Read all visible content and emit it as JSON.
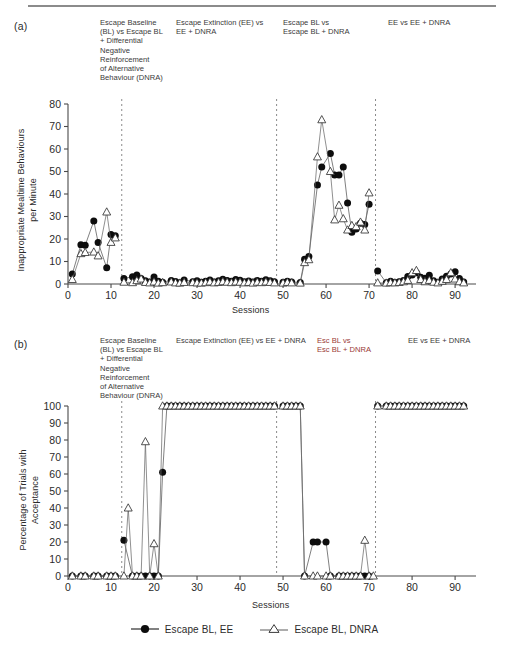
{
  "figure": {
    "panel_a_letter": "(a)",
    "panel_b_letter": "(b)"
  },
  "panel_a": {
    "phase_headers": [
      "Escape Baseline\n(BL) vs Escape BL\n+ Differential\nNegative\nReinforcement\nof Alternative\nBehaviour (DNRA)",
      "Escape Extinction (EE) vs\nEE + DNRA",
      "Escape BL vs\nEscape BL + DNRA",
      "EE vs EE + DNRA"
    ],
    "ylabel": "Inappropriate Mealtime Behaviours\nper Minute",
    "xlabel": "Sessions"
  },
  "panel_b": {
    "phase_headers": [
      "Escape Baseline\n(BL) vs Escape BL\n+ Differential\nNegative\nReinforcement\nof Alternative\nBehaviour (DNRA)",
      "Escape Extinction (EE) vs EE + DNRA",
      "Esc BL vs\nEsc BL + DNRA",
      "EE vs EE + DNRA"
    ],
    "ylabel": "Percentage of Trials with\nAcceptance",
    "xlabel": "Sessions"
  },
  "legend": {
    "items": [
      {
        "label": "Escape BL, EE",
        "marker": "filled-circle"
      },
      {
        "label": "Escape BL, DNRA",
        "marker": "open-triangle"
      }
    ]
  },
  "chart_data": [
    {
      "id": "panel-a",
      "type": "line",
      "title": "",
      "xlabel": "Sessions",
      "ylabel": "Inappropriate Mealtime Behaviours per Minute",
      "xlim": [
        0,
        93
      ],
      "ylim": [
        0,
        80
      ],
      "xticks": [
        0,
        10,
        20,
        30,
        40,
        50,
        60,
        70,
        80,
        90
      ],
      "yticks": [
        0,
        10,
        20,
        30,
        40,
        50,
        60,
        70,
        80
      ],
      "grid": false,
      "legend_position": "bottom",
      "phase_lines": [
        12.5,
        48.5,
        71.5
      ],
      "series": [
        {
          "name": "Escape BL, EE",
          "marker": "filled-circle",
          "x": [
            1,
            3,
            4,
            6,
            7,
            9,
            10,
            11,
            13,
            15,
            16,
            17,
            18,
            19,
            20,
            21,
            22,
            24,
            25,
            26,
            27,
            29,
            30,
            31,
            32,
            33,
            34,
            35,
            36,
            37,
            38,
            39,
            40,
            41,
            42,
            43,
            44,
            45,
            46,
            47,
            48,
            50,
            51,
            52,
            54,
            55,
            56,
            58,
            59,
            61,
            62,
            63,
            64,
            65,
            66,
            67,
            68,
            69,
            70,
            72,
            74,
            75,
            76,
            77,
            78,
            79,
            80,
            81,
            82,
            83,
            84,
            85,
            86,
            87,
            88,
            89,
            90,
            91,
            92
          ],
          "y": [
            4.5,
            17.5,
            17.2,
            28.0,
            18.5,
            7.2,
            22.0,
            21.5,
            2.5,
            3.2,
            4.0,
            2.5,
            1.4,
            0.9,
            3.1,
            1.2,
            0.8,
            1.6,
            1.1,
            0.6,
            1.8,
            1.0,
            1.4,
            0.8,
            1.2,
            1.8,
            0.9,
            1.5,
            2.1,
            1.6,
            1.2,
            2.0,
            1.7,
            1.0,
            1.3,
            0.9,
            1.6,
            1.2,
            1.9,
            1.4,
            1.0,
            0.8,
            1.2,
            0.9,
            0.7,
            11.0,
            12.2,
            44.0,
            52.0,
            58.0,
            48.5,
            48.5,
            52.0,
            36.0,
            23.0,
            24.5,
            27.0,
            26.5,
            35.5,
            5.8,
            0.6,
            1.2,
            0.7,
            1.0,
            1.6,
            3.3,
            4.0,
            5.0,
            3.0,
            2.6,
            3.9,
            1.4,
            0.7,
            2.2,
            3.5,
            4.4,
            5.5,
            2.4,
            0.9
          ]
        },
        {
          "name": "Escape BL, DNRA",
          "marker": "open-triangle",
          "x": [
            1,
            3,
            4,
            6,
            7,
            9,
            10,
            11,
            13,
            15,
            16,
            17,
            18,
            19,
            20,
            21,
            22,
            24,
            25,
            26,
            27,
            29,
            30,
            31,
            32,
            33,
            34,
            35,
            36,
            37,
            38,
            39,
            40,
            41,
            42,
            43,
            44,
            45,
            46,
            47,
            48,
            50,
            51,
            52,
            54,
            55,
            56,
            58,
            59,
            61,
            62,
            63,
            64,
            65,
            66,
            67,
            68,
            69,
            70,
            72,
            74,
            75,
            76,
            77,
            78,
            79,
            80,
            81,
            82,
            83,
            84,
            85,
            86,
            87,
            88,
            89,
            90,
            91,
            92
          ],
          "y": [
            2.0,
            13.5,
            14.0,
            14.2,
            12.5,
            32.0,
            18.5,
            20.5,
            0.8,
            0.6,
            1.5,
            2.2,
            0.7,
            0.5,
            0.9,
            0.4,
            0.6,
            0.9,
            0.5,
            0.4,
            0.7,
            0.6,
            0.5,
            0.4,
            0.6,
            0.9,
            0.5,
            0.7,
            1.0,
            0.8,
            0.6,
            0.9,
            0.8,
            0.5,
            0.7,
            0.4,
            0.8,
            0.6,
            0.9,
            0.7,
            0.5,
            0.4,
            0.7,
            0.5,
            0.4,
            9.5,
            10.8,
            56.5,
            73.0,
            50.0,
            28.5,
            35.0,
            29.0,
            24.0,
            26.0,
            25.5,
            27.5,
            24.0,
            40.5,
            0.5,
            0.4,
            0.6,
            0.5,
            0.7,
            1.0,
            1.6,
            5.0,
            6.0,
            2.0,
            1.0,
            1.6,
            0.8,
            0.5,
            1.2,
            2.0,
            5.0,
            2.2,
            1.0,
            0.5
          ]
        }
      ]
    },
    {
      "id": "panel-b",
      "type": "line",
      "title": "",
      "xlabel": "Sessions",
      "ylabel": "Percentage of Trials with Acceptance",
      "xlim": [
        0,
        93
      ],
      "ylim": [
        0,
        100
      ],
      "xticks": [
        0,
        10,
        20,
        30,
        40,
        50,
        60,
        70,
        80,
        90
      ],
      "yticks": [
        0,
        10,
        20,
        30,
        40,
        50,
        60,
        70,
        80,
        90,
        100
      ],
      "grid": false,
      "legend_position": "bottom",
      "phase_lines": [
        12.5,
        48.5,
        71.5
      ],
      "series": [
        {
          "name": "Escape BL, EE",
          "marker": "filled-circle",
          "x": [
            1,
            3,
            4,
            6,
            7,
            9,
            10,
            11,
            13,
            15,
            16,
            17,
            18,
            19,
            20,
            21,
            22,
            23,
            24,
            25,
            26,
            27,
            28,
            29,
            30,
            31,
            32,
            33,
            34,
            35,
            36,
            37,
            38,
            39,
            40,
            41,
            42,
            43,
            44,
            45,
            46,
            47,
            48,
            50,
            51,
            52,
            53,
            54,
            55,
            57,
            58,
            60,
            61,
            63,
            64,
            65,
            66,
            67,
            68,
            69,
            70,
            72,
            74,
            75,
            76,
            77,
            78,
            79,
            80,
            81,
            82,
            83,
            84,
            85,
            86,
            87,
            88,
            89,
            90,
            91,
            92
          ],
          "y": [
            0,
            0,
            0,
            0,
            0,
            0,
            0,
            0,
            21,
            0,
            0,
            0,
            0,
            0,
            0,
            0,
            61,
            100,
            100,
            100,
            100,
            100,
            100,
            100,
            100,
            100,
            100,
            100,
            100,
            100,
            100,
            100,
            100,
            100,
            100,
            100,
            100,
            100,
            100,
            100,
            100,
            100,
            100,
            100,
            100,
            100,
            100,
            100,
            0,
            20,
            20,
            20,
            0,
            0,
            0,
            0,
            0,
            0,
            0,
            0,
            0,
            100,
            100,
            100,
            100,
            100,
            100,
            100,
            100,
            100,
            100,
            100,
            100,
            100,
            100,
            100,
            100,
            100,
            100,
            100,
            100
          ]
        },
        {
          "name": "Escape BL, DNRA",
          "marker": "open-triangle",
          "x": [
            1,
            3,
            4,
            6,
            7,
            9,
            10,
            11,
            13,
            14,
            15,
            16,
            17,
            18,
            19,
            20,
            21,
            22,
            23,
            24,
            25,
            26,
            27,
            28,
            29,
            30,
            31,
            32,
            33,
            34,
            35,
            36,
            37,
            38,
            39,
            40,
            41,
            42,
            43,
            44,
            45,
            46,
            47,
            48,
            50,
            51,
            52,
            53,
            54,
            55,
            57,
            58,
            60,
            61,
            63,
            64,
            65,
            66,
            67,
            68,
            69,
            70,
            71,
            72,
            74,
            75,
            76,
            77,
            78,
            79,
            80,
            81,
            82,
            83,
            84,
            85,
            86,
            87,
            88,
            89,
            90,
            91,
            92
          ],
          "y": [
            0,
            0,
            0,
            0,
            0,
            0,
            0,
            0,
            0,
            40,
            0,
            0,
            0,
            79,
            0,
            19,
            0,
            100,
            100,
            100,
            100,
            100,
            100,
            100,
            100,
            100,
            100,
            100,
            100,
            100,
            100,
            100,
            100,
            100,
            100,
            100,
            100,
            100,
            100,
            100,
            100,
            100,
            100,
            100,
            100,
            100,
            100,
            100,
            100,
            0,
            0,
            0,
            0,
            0,
            0,
            0,
            0,
            0,
            0,
            0,
            21,
            0,
            0,
            100,
            100,
            100,
            100,
            100,
            100,
            100,
            100,
            100,
            100,
            100,
            100,
            100,
            100,
            100,
            100,
            100,
            100,
            100,
            100
          ]
        }
      ]
    }
  ]
}
